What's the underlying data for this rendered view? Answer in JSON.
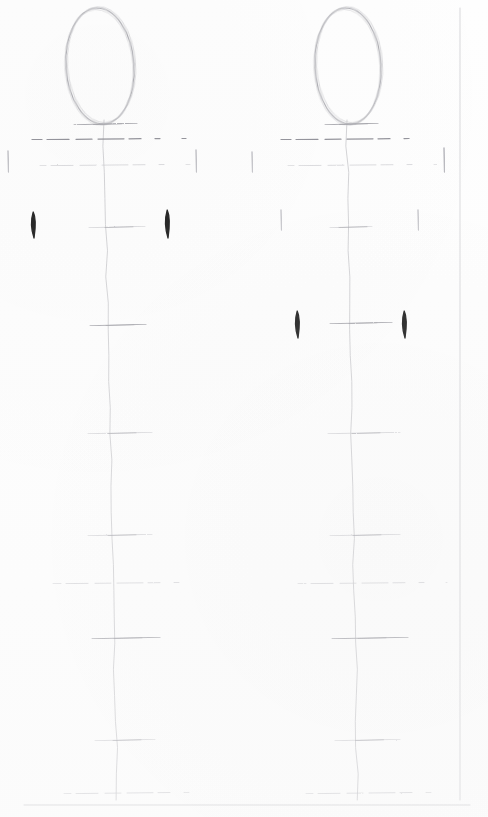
{
  "artwork": {
    "title": "Figure Proportion Construction Sketch",
    "medium": "graphite pencil on white paper",
    "subject": "two mannequin / gesture proportion diagrams",
    "canvas": {
      "width": 488,
      "height": 817,
      "background_color": "#fefefe"
    },
    "ink": {
      "graphite_light": "#c9c9cd",
      "graphite_mid": "#a8a8ae",
      "graphite_dark": "#8a8a92",
      "accent_black": "#141414",
      "paper_edge": "#d7d7da"
    }
  },
  "page_edges": [
    {
      "name": "right-margin-rule",
      "orientation": "vertical",
      "x": 460,
      "y1": 8,
      "y2": 800
    },
    {
      "name": "bottom-margin-rule",
      "orientation": "horizontal",
      "y": 805,
      "x1": 24,
      "x2": 470
    }
  ],
  "figures": [
    {
      "id": "figure-left",
      "label": "Left proportion figure",
      "center_x": 108,
      "head": {
        "name": "head-oval",
        "cx": 100,
        "cy": 66,
        "rx": 34,
        "ry": 58,
        "rotation": -4,
        "double_stroke": true
      },
      "spine": {
        "name": "plumb-line",
        "x_top": 104,
        "y_top": 120,
        "x_bottom": 117,
        "y_bottom": 800,
        "waver": true
      },
      "ticks": [
        {
          "name": "chin-line",
          "y": 124,
          "x1": 74,
          "x2": 137,
          "weight": "mid",
          "dashed": false
        },
        {
          "name": "shoulder-line",
          "y": 139,
          "x1": 32,
          "x2": 186,
          "weight": "dark",
          "dashed": true
        },
        {
          "name": "chest-line",
          "y": 165,
          "x1": 40,
          "x2": 190,
          "weight": "light",
          "dashed": true
        },
        {
          "name": "nipple-line",
          "y": 227,
          "x1": 89,
          "x2": 145,
          "weight": "light",
          "dashed": false
        },
        {
          "name": "waist-line",
          "y": 325,
          "x1": 90,
          "x2": 146,
          "weight": "mid",
          "dashed": false
        },
        {
          "name": "hip-line",
          "y": 433,
          "x1": 88,
          "x2": 152,
          "weight": "light",
          "dashed": false
        },
        {
          "name": "crotch-line",
          "y": 535,
          "x1": 88,
          "x2": 152,
          "weight": "light",
          "dashed": false
        },
        {
          "name": "thigh-line",
          "y": 583,
          "x1": 53,
          "x2": 198,
          "weight": "light",
          "dashed": true
        },
        {
          "name": "knee-line",
          "y": 638,
          "x1": 92,
          "x2": 160,
          "weight": "mid",
          "dashed": false
        },
        {
          "name": "calf-line",
          "y": 740,
          "x1": 95,
          "x2": 155,
          "weight": "light",
          "dashed": false
        },
        {
          "name": "ankle-line",
          "y": 793,
          "x1": 64,
          "x2": 190,
          "weight": "light",
          "dashed": true
        }
      ],
      "side_marks": [
        {
          "name": "left-shoulder-tick",
          "x": 8,
          "y1": 151,
          "y2": 172,
          "weight": "light",
          "color": "#b6b6bc"
        },
        {
          "name": "right-shoulder-tick",
          "x": 196,
          "y1": 150,
          "y2": 172,
          "weight": "light",
          "color": "#b6b6bc"
        },
        {
          "name": "left-elbow-mark",
          "x": 33,
          "y1": 212,
          "y2": 238,
          "weight": "black",
          "color": "#141414"
        },
        {
          "name": "right-elbow-mark",
          "x": 167,
          "y1": 210,
          "y2": 238,
          "weight": "black",
          "color": "#141414"
        }
      ]
    },
    {
      "id": "figure-right",
      "label": "Right proportion figure",
      "center_x": 350,
      "head": {
        "name": "head-oval",
        "cx": 348,
        "cy": 66,
        "rx": 33,
        "ry": 58,
        "rotation": -3,
        "double_stroke": true
      },
      "spine": {
        "name": "plumb-line",
        "x_top": 347,
        "y_top": 120,
        "x_bottom": 358,
        "y_bottom": 800,
        "waver": true
      },
      "ticks": [
        {
          "name": "chin-line",
          "y": 124,
          "x1": 325,
          "x2": 378,
          "weight": "mid",
          "dashed": false
        },
        {
          "name": "shoulder-line",
          "y": 139,
          "x1": 281,
          "x2": 430,
          "weight": "dark",
          "dashed": true
        },
        {
          "name": "chest-line",
          "y": 165,
          "x1": 288,
          "x2": 437,
          "weight": "light",
          "dashed": true
        },
        {
          "name": "nipple-line",
          "y": 227,
          "x1": 330,
          "x2": 372,
          "weight": "light",
          "dashed": false
        },
        {
          "name": "waist-line",
          "y": 323,
          "x1": 330,
          "x2": 392,
          "weight": "mid",
          "dashed": false
        },
        {
          "name": "hip-line",
          "y": 433,
          "x1": 328,
          "x2": 400,
          "weight": "light",
          "dashed": false
        },
        {
          "name": "crotch-line",
          "y": 535,
          "x1": 330,
          "x2": 400,
          "weight": "light",
          "dashed": false
        },
        {
          "name": "thigh-line",
          "y": 583,
          "x1": 298,
          "x2": 447,
          "weight": "light",
          "dashed": true
        },
        {
          "name": "knee-line",
          "y": 638,
          "x1": 332,
          "x2": 408,
          "weight": "mid",
          "dashed": false
        },
        {
          "name": "calf-line",
          "y": 740,
          "x1": 335,
          "x2": 400,
          "weight": "light",
          "dashed": false
        },
        {
          "name": "ankle-line",
          "y": 793,
          "x1": 306,
          "x2": 432,
          "weight": "light",
          "dashed": true
        }
      ],
      "side_marks": [
        {
          "name": "left-shoulder-tick",
          "x": 252,
          "y1": 152,
          "y2": 172,
          "weight": "light",
          "color": "#b9b9bf"
        },
        {
          "name": "right-shoulder-tick",
          "x": 444,
          "y1": 148,
          "y2": 172,
          "weight": "light",
          "color": "#a9a9b0"
        },
        {
          "name": "left-rib-tick",
          "x": 281,
          "y1": 210,
          "y2": 230,
          "weight": "light",
          "color": "#bcbcc2"
        },
        {
          "name": "right-rib-tick",
          "x": 418,
          "y1": 210,
          "y2": 230,
          "weight": "light",
          "color": "#bcbcc2"
        },
        {
          "name": "left-hand-mark",
          "x": 297,
          "y1": 311,
          "y2": 338,
          "weight": "black",
          "color": "#141414"
        },
        {
          "name": "right-hand-mark",
          "x": 404,
          "y1": 311,
          "y2": 338,
          "weight": "black",
          "color": "#141414"
        }
      ]
    }
  ]
}
